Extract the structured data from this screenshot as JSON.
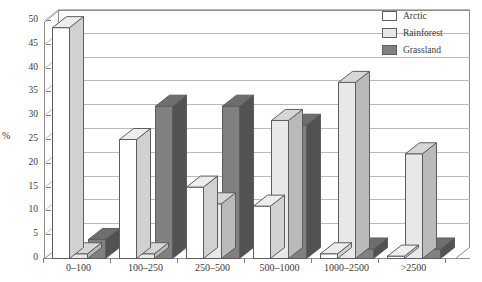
{
  "chart_data": {
    "type": "bar",
    "title": "",
    "xlabel": "",
    "ylabel": "%",
    "categories": [
      "0-100",
      "100-250",
      "250-500",
      "500-1000",
      "1000-2500",
      ">2500"
    ],
    "series": [
      {
        "name": "Arctic",
        "color": "#ffffff",
        "values": [
          48.5,
          25.0,
          15.0,
          11.0,
          1.0,
          0.5
        ]
      },
      {
        "name": "Rainforest",
        "color": "#e8e8e8",
        "values": [
          1.0,
          1.0,
          11.5,
          29.0,
          37.0,
          22.0
        ]
      },
      {
        "name": "Grassland",
        "color": "#808080",
        "values": [
          4.0,
          32.0,
          32.0,
          28.0,
          2.0,
          2.0
        ]
      }
    ],
    "ylim": [
      0,
      50
    ],
    "yticks": [
      0,
      5,
      10,
      15,
      20,
      25,
      30,
      35,
      40,
      45,
      50
    ],
    "grid": true,
    "legend_position": "top-right",
    "style": "3d-column"
  },
  "legend": {
    "items": [
      {
        "label": "Arctic"
      },
      {
        "label": "Rainforest"
      },
      {
        "label": "Grassland"
      }
    ]
  }
}
